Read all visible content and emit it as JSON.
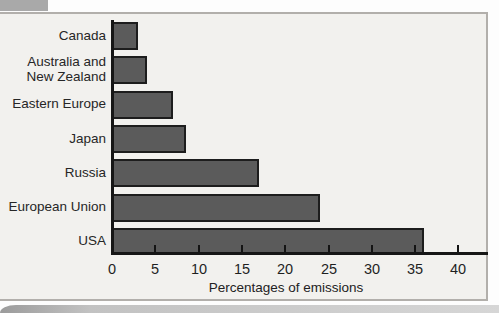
{
  "page": {
    "background_color": "#fdfdfd",
    "panel_background": "#f2f1ee",
    "panel_border_color": "#b2afab",
    "corner_tab_color": "#a9a9a9",
    "page_curl_color": "#c2c2c2"
  },
  "chart_data": {
    "type": "bar",
    "orientation": "horizontal",
    "title": "",
    "xlabel": "Percentages of emissions",
    "ylabel": "",
    "xlim": [
      0,
      43
    ],
    "xticks": [
      0,
      5,
      10,
      15,
      20,
      25,
      30,
      35,
      40
    ],
    "grid": false,
    "legend": "none",
    "bar_color": "#5b5b5b",
    "bar_border_color": "#1d1d1d",
    "categories": [
      "Canada",
      "Australia and New Zealand",
      "Eastern Europe",
      "Japan",
      "Russia",
      "European Union",
      "USA"
    ],
    "category_label_lines": [
      [
        "Canada"
      ],
      [
        "Australia and",
        "New Zealand"
      ],
      [
        "Eastern Europe"
      ],
      [
        "Japan"
      ],
      [
        "Russia"
      ],
      [
        "European Union"
      ],
      [
        "USA"
      ]
    ],
    "values": [
      3,
      4,
      7,
      8.5,
      17,
      24,
      36
    ]
  }
}
